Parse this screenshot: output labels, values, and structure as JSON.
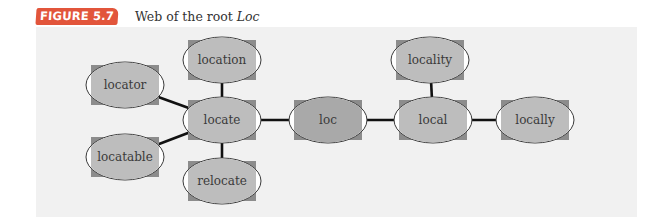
{
  "figure": {
    "badge": "FIGURE 5.7",
    "caption_prefix": "Web of the root ",
    "caption_root": "Loc"
  },
  "colors": {
    "badge": "#e2553b",
    "panel": "#f1f1f1",
    "node_fill": "#bdbdbd",
    "center_fill": "#a9a9a9",
    "node_square": "#8c8c8c",
    "edge": "#111111"
  },
  "nodes": [
    {
      "id": "locator",
      "label": "locator",
      "cx": 125,
      "cy": 85
    },
    {
      "id": "location",
      "label": "location",
      "cx": 222,
      "cy": 60
    },
    {
      "id": "locate",
      "label": "locate",
      "cx": 222,
      "cy": 120
    },
    {
      "id": "locatable",
      "label": "locatable",
      "cx": 125,
      "cy": 157
    },
    {
      "id": "relocate",
      "label": "relocate",
      "cx": 222,
      "cy": 181
    },
    {
      "id": "loc",
      "label": "loc",
      "cx": 328,
      "cy": 120,
      "center": true
    },
    {
      "id": "locality",
      "label": "locality",
      "cx": 430,
      "cy": 60
    },
    {
      "id": "local",
      "label": "local",
      "cx": 433,
      "cy": 120
    },
    {
      "id": "locally",
      "label": "locally",
      "cx": 535,
      "cy": 120
    }
  ],
  "edges": [
    [
      "locator",
      "locate"
    ],
    [
      "locatable",
      "locate"
    ],
    [
      "location",
      "locate"
    ],
    [
      "relocate",
      "locate"
    ],
    [
      "locate",
      "loc"
    ],
    [
      "loc",
      "local"
    ],
    [
      "locality",
      "local"
    ],
    [
      "local",
      "locally"
    ]
  ]
}
